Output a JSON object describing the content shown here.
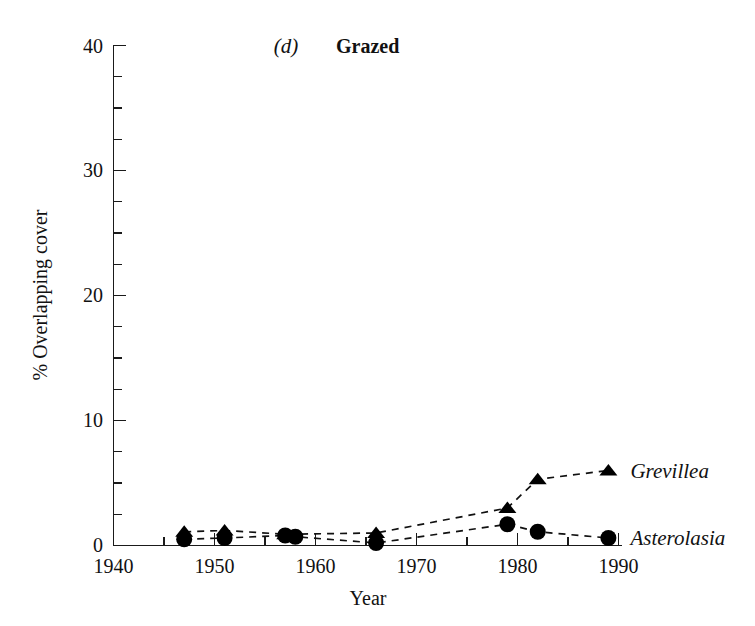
{
  "figure": {
    "panel_letter": "(d)",
    "panel_title": "Grazed"
  },
  "chart_data": {
    "type": "scatter",
    "title": "Grazed",
    "panel_label": "(d)",
    "xlabel": "Year",
    "ylabel": "% Overlapping cover",
    "xlim": [
      1940,
      1991
    ],
    "ylim": [
      0,
      40
    ],
    "xticks": [
      1940,
      1950,
      1960,
      1970,
      1980,
      1990
    ],
    "xtick_labels": [
      "1940",
      "1950",
      "1960",
      "1970",
      "1980",
      "1990"
    ],
    "yticks": [
      0,
      10,
      20,
      30,
      40
    ],
    "ytick_labels": [
      "0",
      "10",
      "20",
      "30",
      "40"
    ],
    "x_minor_step": 5,
    "y_minor_step": 2.5,
    "grid": false,
    "legend_position": "right-inline",
    "series": [
      {
        "name": "Grevillea",
        "marker": "triangle",
        "line_style": "dashed",
        "x": [
          1947,
          1951,
          1957,
          1966,
          1979,
          1982,
          1989
        ],
        "values": [
          1.1,
          1.2,
          0.9,
          1.0,
          3.0,
          5.3,
          6.0
        ],
        "label_x": 1991,
        "label_y": 6.0
      },
      {
        "name": "Asterolasia",
        "marker": "circle",
        "line_style": "dashed",
        "x": [
          1947,
          1951,
          1957,
          1958,
          1966,
          1979,
          1982,
          1989
        ],
        "values": [
          0.5,
          0.6,
          0.8,
          0.7,
          0.2,
          1.7,
          1.1,
          0.6
        ],
        "label_x": 1991,
        "label_y": 0.7
      }
    ]
  },
  "axis": {
    "y_label_text": "% Overlapping cover",
    "x_label_text": "Year",
    "ytick_0": "0",
    "ytick_10": "10",
    "ytick_20": "20",
    "ytick_30": "30",
    "ytick_40": "40",
    "xtick_1940": "1940",
    "xtick_1950": "1950",
    "xtick_1960": "1960",
    "xtick_1970": "1970",
    "xtick_1980": "1980",
    "xtick_1990": "1990"
  },
  "legend": {
    "grevillea": "Grevillea",
    "asterolasia": "Asterolasia"
  },
  "colors": {
    "marker": "#000000",
    "axis": "#1a1a1a",
    "background": "#ffffff"
  }
}
